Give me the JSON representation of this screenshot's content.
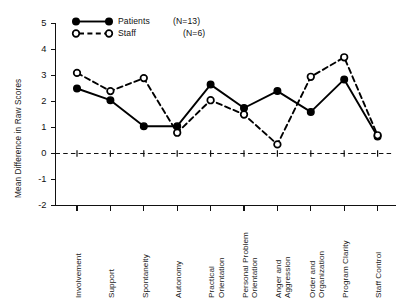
{
  "chart_data": {
    "type": "line",
    "title": "",
    "xlabel": "",
    "ylabel": "Mean Difference in Raw Scores",
    "ylim": [
      -2,
      5
    ],
    "yticks": [
      5,
      4,
      3,
      2,
      1,
      0,
      -1,
      -2
    ],
    "ytick_labels": [
      "5",
      "4",
      "3",
      "2",
      "1",
      "0",
      "-1",
      "-2"
    ],
    "grid": false,
    "zero_reference_line": 0,
    "legend_position": "top-left-inside",
    "categories": [
      "Involvement",
      "Support",
      "Spontaneity",
      "Autonomy",
      "Practical Orientation",
      "Personal Problem Orientation",
      "Anger and Aggression",
      "Order and Organization",
      "Program Clarity",
      "Staff Control"
    ],
    "category_lines": [
      [
        "Involvement"
      ],
      [
        "Support"
      ],
      [
        "Spontaneity"
      ],
      [
        "Autonomy"
      ],
      [
        "Practical",
        "Orientation"
      ],
      [
        "Personal Problem",
        "Orientation"
      ],
      [
        "Anger and",
        "Aggression"
      ],
      [
        "Order and",
        "Organization"
      ],
      [
        "Program Clarity"
      ],
      [
        "Staff Control"
      ]
    ],
    "series": [
      {
        "name": "Patients",
        "legend_label": "Patients",
        "n_label": "(N=13)",
        "n": 13,
        "marker": "filled-circle",
        "linestyle": "solid",
        "color": "#000000",
        "values": [
          2.5,
          2.05,
          1.05,
          1.05,
          2.65,
          1.75,
          2.4,
          1.6,
          2.85,
          0.65
        ]
      },
      {
        "name": "Staff",
        "legend_label": "Staff",
        "n_label": "(N=6)",
        "n": 6,
        "marker": "open-circle",
        "linestyle": "dashed",
        "color": "#000000",
        "values": [
          3.1,
          2.4,
          2.9,
          0.8,
          2.05,
          1.5,
          0.35,
          2.95,
          3.7,
          0.7
        ]
      }
    ]
  },
  "axis": {
    "y_title": "Mean Difference in Raw Scores"
  },
  "legend": {
    "entries": [
      {
        "label": "Patients",
        "n": "(N=13)"
      },
      {
        "label": "Staff",
        "n": "(N=6)"
      }
    ]
  }
}
